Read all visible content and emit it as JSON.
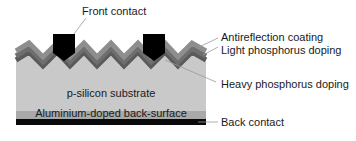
{
  "diagram": {
    "colors": {
      "antireflection": "#8a8a8a",
      "light_doping": "#6e6e6e",
      "heavy_doping": "#454545",
      "substrate": "#c9c9c9",
      "aluminium": "#a9a9a9",
      "back_contact": "#0a0a0a",
      "front_contact": "#000000",
      "leader": "#9a9a9a"
    },
    "labels": {
      "front_contact": "Front contact",
      "antireflection": "Antireflection coating",
      "light_doping": "Light phosphorus doping",
      "heavy_doping": "Heavy phosphorus doping",
      "substrate": "p-silicon substrate",
      "aluminium": "Aluminium-doped back-surface",
      "back_contact": "Back contact"
    }
  }
}
